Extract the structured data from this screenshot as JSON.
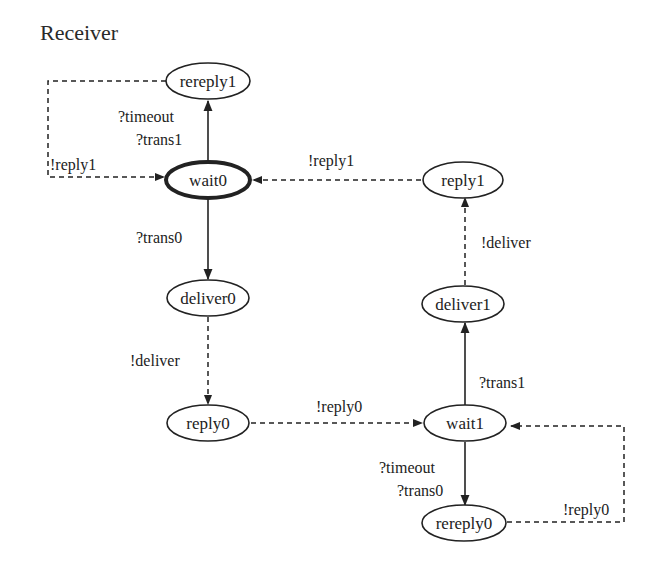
{
  "diagram": {
    "title": "Receiver",
    "nodes": {
      "rereply1": {
        "label": "rereply1",
        "x": 208,
        "y": 81,
        "initial": false
      },
      "wait0": {
        "label": "wait0",
        "x": 208,
        "y": 180,
        "initial": true
      },
      "reply1": {
        "label": "reply1",
        "x": 463,
        "y": 180,
        "initial": false
      },
      "deliver0": {
        "label": "deliver0",
        "x": 208,
        "y": 298,
        "initial": false
      },
      "deliver1": {
        "label": "deliver1",
        "x": 463,
        "y": 304,
        "initial": false
      },
      "reply0": {
        "label": "reply0",
        "x": 208,
        "y": 423,
        "initial": false
      },
      "wait1": {
        "label": "wait1",
        "x": 465,
        "y": 423,
        "initial": false
      },
      "rereply0": {
        "label": "rereply0",
        "x": 464,
        "y": 523,
        "initial": false
      }
    },
    "edges": {
      "wait0_rereply1": {
        "from": "wait0",
        "to": "rereply1",
        "style": "solid",
        "label_line1": "?timeout",
        "label_line2": "?trans1"
      },
      "rereply1_wait0": {
        "from": "rereply1",
        "to": "wait0",
        "style": "dashed",
        "label": "!reply1"
      },
      "reply1_wait0": {
        "from": "reply1",
        "to": "wait0",
        "style": "dashed",
        "label": "!reply1"
      },
      "wait0_deliver0": {
        "from": "wait0",
        "to": "deliver0",
        "style": "solid",
        "label": "?trans0"
      },
      "deliver0_reply0": {
        "from": "deliver0",
        "to": "reply0",
        "style": "dashed",
        "label": "!deliver"
      },
      "reply0_wait1": {
        "from": "reply0",
        "to": "wait1",
        "style": "dashed",
        "label": "!reply0"
      },
      "wait1_deliver1": {
        "from": "wait1",
        "to": "deliver1",
        "style": "solid",
        "label": "?trans1"
      },
      "deliver1_reply1": {
        "from": "deliver1",
        "to": "reply1",
        "style": "dashed",
        "label": "!deliver"
      },
      "wait1_rereply0": {
        "from": "wait1",
        "to": "rereply0",
        "style": "solid",
        "label_line1": "?timeout",
        "label_line2": "?trans0"
      },
      "rereply0_wait1": {
        "from": "rereply0",
        "to": "wait1",
        "style": "dashed",
        "label": "!reply0"
      }
    }
  }
}
